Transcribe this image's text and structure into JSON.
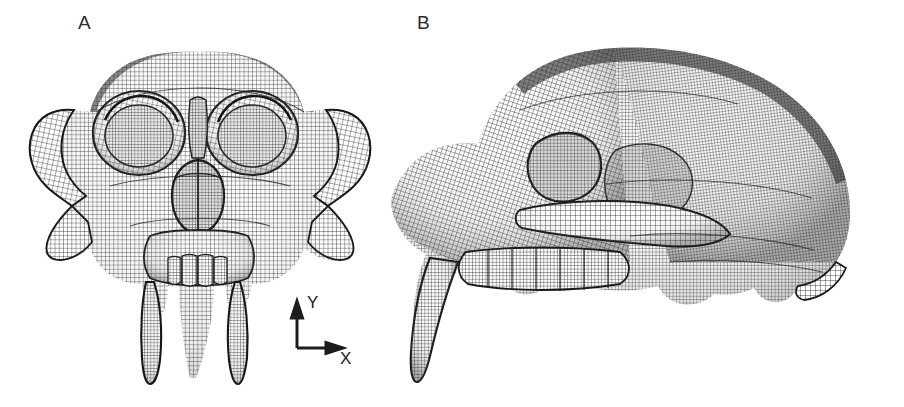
{
  "figure": {
    "background_color": "#ffffff",
    "ink_color": "#1d1d1d",
    "panel_count": 2
  },
  "panels": [
    {
      "label": "A",
      "view": "anterior",
      "subject": "skull-mesh",
      "axes": {
        "vertical": {
          "name": "Y",
          "direction": "up"
        },
        "horizontal": {
          "name": "X",
          "direction": "right"
        }
      }
    },
    {
      "label": "B",
      "view": "lateral",
      "subject": "skull-mesh",
      "axes": {
        "vertical": {
          "name": "Y",
          "direction": "up"
        },
        "horizontal": {
          "name": "Z",
          "direction": "left"
        }
      }
    }
  ],
  "axis_indicator_a": {
    "y_label": "Y",
    "x_label": "X"
  },
  "axis_indicator_b": {
    "y_label": "Y",
    "z_label": "Z"
  }
}
